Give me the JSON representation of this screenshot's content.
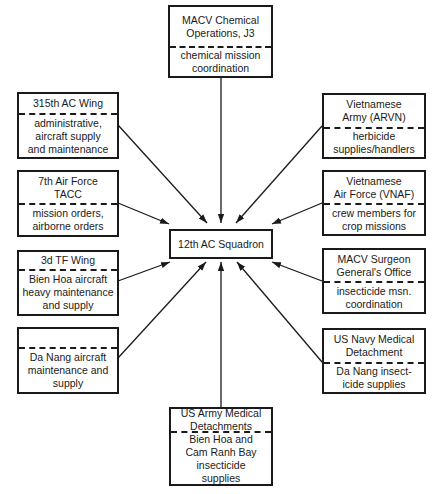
{
  "center": {
    "label": "12th AC Squadron"
  },
  "nodes": {
    "macv_chem": {
      "title": "MACV Chemical Operations, J3",
      "title_lines": [
        "MACV Chemical",
        "Operations, J3"
      ],
      "role": "chemical mission coordination",
      "role_lines": [
        "chemical mission",
        "coordination"
      ]
    },
    "ac_wing_315": {
      "title": "315th AC Wing",
      "role": "administrative, aircraft supply and maintenance",
      "role_lines": [
        "administrative,",
        "aircraft supply",
        "and maintenance"
      ]
    },
    "af7_tacc": {
      "title": "7th Air Force TACC",
      "title_lines": [
        "7th Air Force",
        "TACC"
      ],
      "role": "mission orders, airborne orders",
      "role_lines": [
        "mission orders,",
        "airborne orders"
      ]
    },
    "tf_wing_3d": {
      "title": "3d TF Wing",
      "role": "Bien Hoa aircraft heavy maintenance and supply",
      "role_lines": [
        "Bien Hoa aircraft",
        "heavy maintenance",
        "and supply"
      ]
    },
    "da_nang": {
      "title": "",
      "role": "Da Nang aircraft maintenance and supply",
      "role_lines": [
        "Da Nang aircraft",
        "maintenance and",
        "supply"
      ]
    },
    "arvn": {
      "title": "Vietnamese Army (ARVN)",
      "title_lines": [
        "Vietnamese",
        "Army (ARVN)"
      ],
      "role": "herbicide supplies/handlers",
      "role_lines": [
        "herbicide",
        "supplies/handlers"
      ]
    },
    "vnaf": {
      "title": "Vietnamese Air Force (VNAF)",
      "title_lines": [
        "Vietnamese",
        "Air Force (VNAF)"
      ],
      "role": "crew members for crop missions",
      "role_lines": [
        "crew members for",
        "crop missions"
      ]
    },
    "macv_surgeon": {
      "title": "MACV Surgeon General's Office",
      "title_lines": [
        "MACV Surgeon",
        "General's Office"
      ],
      "role": "insecticide msn. coordination",
      "role_lines": [
        "insecticide msn.",
        "coordination"
      ]
    },
    "us_navy": {
      "title": "US Navy Medical Detachment",
      "title_lines": [
        "US Navy Medical",
        "Detachment"
      ],
      "role": "Da Nang insecticide supplies",
      "role_lines": [
        "Da Nang insect-",
        "icide supplies"
      ]
    },
    "us_army": {
      "title": "US Army Medical Detachments",
      "title_lines": [
        "US Army Medical",
        "Detachments"
      ],
      "role": "Bien Hoa and Cam Ranh Bay insecticide supplies",
      "role_lines": [
        "Bien Hoa and",
        "Cam Ranh Bay",
        "insecticide",
        "supplies"
      ]
    }
  },
  "edges": [
    {
      "from": "macv_chem",
      "to": "center"
    },
    {
      "from": "ac_wing_315",
      "to": "center"
    },
    {
      "from": "af7_tacc",
      "to": "center"
    },
    {
      "from": "tf_wing_3d",
      "to": "center"
    },
    {
      "from": "da_nang",
      "to": "center"
    },
    {
      "from": "arvn",
      "to": "center"
    },
    {
      "from": "vnaf",
      "to": "center"
    },
    {
      "from": "macv_surgeon",
      "to": "center"
    },
    {
      "from": "us_navy",
      "to": "center"
    },
    {
      "from": "us_army",
      "to": "center"
    }
  ]
}
